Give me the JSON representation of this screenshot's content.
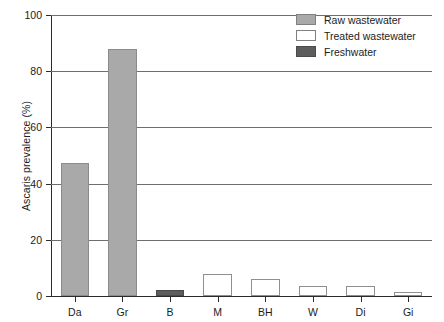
{
  "chart_data": {
    "type": "bar",
    "title": "",
    "subtitle": "",
    "xlabel": "",
    "ylabel": "Ascaris prevalence (%)",
    "ylim": [
      0,
      100
    ],
    "yticks": [
      0,
      20,
      40,
      60,
      80,
      100
    ],
    "ytick_labels": [
      "0",
      "20",
      "40",
      "60",
      "80",
      "100"
    ],
    "grid": "horizontal",
    "legend_position": "top-right",
    "categories": [
      "Da",
      "Gr",
      "B",
      "M",
      "BH",
      "W",
      "Di",
      "Gi"
    ],
    "values": [
      47.5,
      88,
      2,
      8,
      6,
      3.5,
      3.5,
      1.5
    ],
    "point_groups": [
      "Raw wastewater",
      "Raw wastewater",
      "Freshwater",
      "Treated wastewater",
      "Treated wastewater",
      "Treated wastewater",
      "Treated wastewater",
      "Treated wastewater"
    ],
    "series": [
      {
        "name": "Raw wastewater",
        "color": "#a9a9a9",
        "points": [
          {
            "category": "Da",
            "value": 47.5
          },
          {
            "category": "Gr",
            "value": 88
          }
        ]
      },
      {
        "name": "Treated wastewater",
        "color": "#ffffff",
        "points": [
          {
            "category": "M",
            "value": 8
          },
          {
            "category": "BH",
            "value": 6
          },
          {
            "category": "W",
            "value": 3.5
          },
          {
            "category": "Di",
            "value": 3.5
          },
          {
            "category": "Gi",
            "value": 1.5
          }
        ]
      },
      {
        "name": "Freshwater",
        "color": "#5d5d5d",
        "points": [
          {
            "category": "B",
            "value": 2
          }
        ]
      }
    ]
  },
  "legend": {
    "items": [
      {
        "label": "Raw wastewater",
        "kind": "raw"
      },
      {
        "label": "Treated wastewater",
        "kind": "treated"
      },
      {
        "label": "Freshwater",
        "kind": "fresh"
      }
    ]
  }
}
